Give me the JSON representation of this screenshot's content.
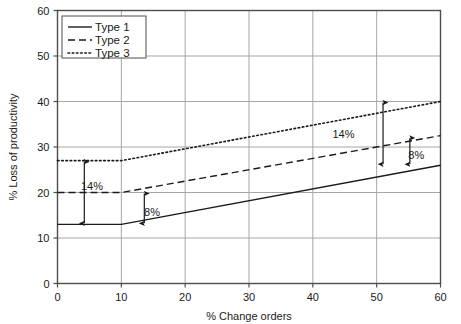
{
  "chart_data": {
    "type": "line",
    "title": "",
    "xlabel": "% Change orders",
    "ylabel": "% Loss of productivity",
    "xlim": [
      0,
      60
    ],
    "ylim": [
      0,
      60
    ],
    "xticks": [
      0,
      10,
      20,
      30,
      40,
      50,
      60
    ],
    "yticks": [
      0,
      10,
      20,
      30,
      40,
      50,
      60
    ],
    "xtick_labels": [
      "0",
      "10",
      "20",
      "30",
      "40",
      "50",
      "60"
    ],
    "ytick_labels": [
      "0",
      "10",
      "20",
      "30",
      "40",
      "50",
      "60"
    ],
    "grid": true,
    "legend_position": "top-left",
    "series": [
      {
        "name": "Type 1",
        "style": "solid",
        "color": "#1a1a1a",
        "x": [
          0,
          10,
          60
        ],
        "values": [
          13,
          13,
          26
        ]
      },
      {
        "name": "Type 2",
        "style": "dashed",
        "color": "#1a1a1a",
        "x": [
          0,
          10,
          60
        ],
        "values": [
          20,
          20,
          32.5
        ]
      },
      {
        "name": "Type 3",
        "style": "dotted",
        "color": "#1a1a1a",
        "x": [
          0,
          10,
          60
        ],
        "values": [
          27,
          27,
          40
        ]
      }
    ],
    "annotations": [
      {
        "name": "left-14-percent",
        "label": "14%",
        "x": 4.2,
        "y_from": 13,
        "y_to": 27,
        "text_x": 5.4,
        "text_y": 21.5
      },
      {
        "name": "left-8-percent",
        "label": "8%",
        "x": 13.6,
        "y_from": 13,
        "y_to": 20,
        "text_x": 14.8,
        "text_y": 15.8
      },
      {
        "name": "right-14-percent",
        "label": "14%",
        "x": 51.0,
        "y_from": 26,
        "y_to": 40,
        "text_x": 44.8,
        "text_y": 32.8
      },
      {
        "name": "right-8-percent",
        "label": "8%",
        "x": 55.2,
        "y_from": 26,
        "y_to": 32.2,
        "text_x": 56.2,
        "text_y": 28.3
      }
    ]
  },
  "legend": {
    "items": [
      {
        "label": "Type 1",
        "style": "solid"
      },
      {
        "label": "Type 2",
        "style": "dashed"
      },
      {
        "label": "Type 3",
        "style": "dotted"
      }
    ]
  },
  "colors": {
    "ink": "#1a1a1a",
    "frame": "#4d4d4d",
    "grid": "#a6a6a6",
    "background": "#ffffff"
  }
}
